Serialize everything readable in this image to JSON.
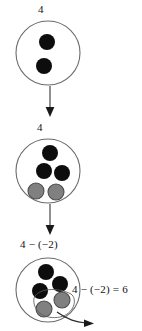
{
  "diagram": {
    "title_semantics": "integer-subtraction-counter-model",
    "colors": {
      "positive_counter": "#0d0d0d",
      "negative_counter": "#808080",
      "negative_counter_stroke": "#4d4d4d",
      "circle_stroke": "#6b6b6b",
      "arrow": "#333333",
      "text": "#111111",
      "background": "#ffffff"
    },
    "stages": [
      {
        "id": "stage-1",
        "label": "4",
        "counters": [
          {
            "type": "positive",
            "cx": 47,
            "cy": 42,
            "r": 8
          },
          {
            "type": "positive",
            "cx": 44,
            "cy": 66,
            "r": 8
          }
        ]
      },
      {
        "id": "stage-2",
        "label": "4",
        "counters": [
          {
            "type": "positive",
            "cx": 50,
            "cy": 152,
            "r": 8
          },
          {
            "type": "positive",
            "cx": 44,
            "cy": 170,
            "r": 8
          },
          {
            "type": "positive",
            "cx": 62,
            "cy": 172,
            "r": 8
          },
          {
            "type": "negative",
            "cx": 36,
            "cy": 190,
            "r": 8
          },
          {
            "type": "negative",
            "cx": 56,
            "cy": 191,
            "r": 8
          }
        ]
      },
      {
        "id": "stage-3",
        "label": "4 − (−2)",
        "equation": "4 − (−2) = 6",
        "counters": [
          {
            "type": "positive",
            "cx": 44,
            "cy": 270,
            "r": 8
          },
          {
            "type": "positive",
            "cx": 58,
            "cy": 282,
            "r": 8
          },
          {
            "type": "positive",
            "cx": 38,
            "cy": 289,
            "r": 8
          },
          {
            "type": "negative",
            "cx": 60,
            "cy": 298,
            "r": 8
          },
          {
            "type": "negative",
            "cx": 42,
            "cy": 307,
            "r": 8
          }
        ]
      }
    ],
    "arrows": [
      {
        "id": "arrow-1",
        "from_stage": "stage-1",
        "to_stage": "stage-2"
      },
      {
        "id": "arrow-2",
        "from_stage": "stage-2",
        "to_stage": "stage-3"
      },
      {
        "id": "removal-arrow",
        "from_stage": "stage-3",
        "meaning": "remove-negative-counters"
      }
    ]
  }
}
